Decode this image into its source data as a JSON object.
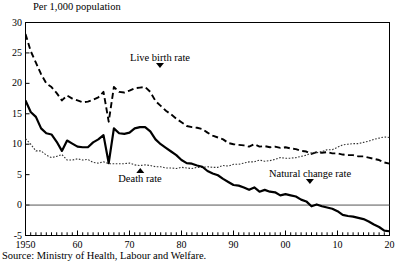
{
  "figure": {
    "unit_label": "Per 1,000 population",
    "title_clipped": "",
    "source": "Source:  Ministry of Health, Labour and Welfare."
  },
  "annotations": [
    {
      "name": "live-birth-rate",
      "label": "Live birth rate",
      "marker": "down"
    },
    {
      "name": "death-rate",
      "label": "Death rate",
      "marker": "up"
    },
    {
      "name": "natural-change-rate",
      "label": "Natural change rate",
      "marker": "down"
    }
  ],
  "chart_data": {
    "type": "line",
    "title": "",
    "subtitle": "Per 1,000 population",
    "xlabel": "",
    "ylabel": "Per 1,000 population",
    "xlim": [
      1950,
      2020
    ],
    "ylim": [
      -5,
      30
    ],
    "yticks": [
      30,
      25,
      20,
      15,
      10,
      5,
      0,
      -5
    ],
    "xticks": [
      1950,
      1960,
      1970,
      1980,
      1990,
      2000,
      2010,
      2020
    ],
    "xticklabels": [
      "1950",
      "60",
      "70",
      "80",
      "90",
      "00",
      "10",
      "20"
    ],
    "minor_xtick_interval": 1,
    "grid": false,
    "legend": "annotated-inline",
    "zero_line": 0,
    "x": [
      1950,
      1951,
      1952,
      1953,
      1954,
      1955,
      1956,
      1957,
      1958,
      1959,
      1960,
      1961,
      1962,
      1963,
      1964,
      1965,
      1966,
      1967,
      1968,
      1969,
      1970,
      1971,
      1972,
      1973,
      1974,
      1975,
      1976,
      1977,
      1978,
      1979,
      1980,
      1981,
      1982,
      1983,
      1984,
      1985,
      1986,
      1987,
      1988,
      1989,
      1990,
      1991,
      1992,
      1993,
      1994,
      1995,
      1996,
      1997,
      1998,
      1999,
      2000,
      2001,
      2002,
      2003,
      2004,
      2005,
      2006,
      2007,
      2008,
      2009,
      2010,
      2011,
      2012,
      2013,
      2014,
      2015,
      2016,
      2017,
      2018,
      2019,
      2020
    ],
    "series": [
      {
        "name": "Live birth rate",
        "style": "dashed",
        "values": [
          28.1,
          25.3,
          23.4,
          21.5,
          20.0,
          19.4,
          18.4,
          17.2,
          18.0,
          17.5,
          17.2,
          16.9,
          17.0,
          17.3,
          17.7,
          18.6,
          13.7,
          19.4,
          18.6,
          18.5,
          18.8,
          19.2,
          19.3,
          19.4,
          18.6,
          17.1,
          16.3,
          15.5,
          14.9,
          14.2,
          13.6,
          13.0,
          12.8,
          12.7,
          12.5,
          11.9,
          11.4,
          11.1,
          10.8,
          10.2,
          10.0,
          9.9,
          9.8,
          9.6,
          10.0,
          9.6,
          9.7,
          9.5,
          9.6,
          9.4,
          9.5,
          9.3,
          9.2,
          8.9,
          8.8,
          8.4,
          8.7,
          8.6,
          8.7,
          8.5,
          8.5,
          8.3,
          8.2,
          8.2,
          8.0,
          8.0,
          7.8,
          7.6,
          7.4,
          7.0,
          6.8
        ]
      },
      {
        "name": "Death rate",
        "style": "dotted",
        "values": [
          10.9,
          10.0,
          8.9,
          8.9,
          8.2,
          7.8,
          8.0,
          8.3,
          7.4,
          7.4,
          7.6,
          7.4,
          7.5,
          7.0,
          6.9,
          7.1,
          6.8,
          6.8,
          6.8,
          6.8,
          6.9,
          6.6,
          6.5,
          6.6,
          6.5,
          6.3,
          6.3,
          6.1,
          6.1,
          6.0,
          6.2,
          6.1,
          6.0,
          6.2,
          6.2,
          6.3,
          6.2,
          6.2,
          6.5,
          6.4,
          6.7,
          6.7,
          6.9,
          7.1,
          7.1,
          7.4,
          7.2,
          7.3,
          7.5,
          7.8,
          7.7,
          7.7,
          7.8,
          8.0,
          8.2,
          8.6,
          8.6,
          8.8,
          9.1,
          9.1,
          9.5,
          9.9,
          10.0,
          10.1,
          10.1,
          10.3,
          10.5,
          10.8,
          11.0,
          11.2,
          11.1
        ]
      },
      {
        "name": "Natural change rate",
        "style": "solid",
        "values": [
          17.2,
          15.3,
          14.5,
          12.6,
          11.8,
          11.6,
          10.4,
          8.9,
          10.6,
          10.1,
          9.6,
          9.5,
          9.5,
          10.3,
          10.8,
          11.5,
          6.9,
          12.6,
          11.8,
          11.7,
          11.9,
          12.6,
          12.8,
          12.8,
          12.1,
          10.8,
          10.0,
          9.4,
          8.8,
          8.2,
          7.4,
          6.9,
          6.8,
          6.5,
          6.3,
          5.6,
          5.2,
          4.9,
          4.3,
          3.8,
          3.3,
          3.2,
          2.9,
          2.5,
          2.9,
          2.2,
          2.5,
          2.2,
          2.1,
          1.6,
          1.8,
          1.6,
          1.4,
          0.9,
          0.6,
          -0.2,
          0.1,
          -0.2,
          -0.4,
          -0.6,
          -1.0,
          -1.6,
          -1.8,
          -1.9,
          -2.1,
          -2.3,
          -2.7,
          -3.2,
          -3.6,
          -4.2,
          -4.3
        ]
      }
    ]
  }
}
